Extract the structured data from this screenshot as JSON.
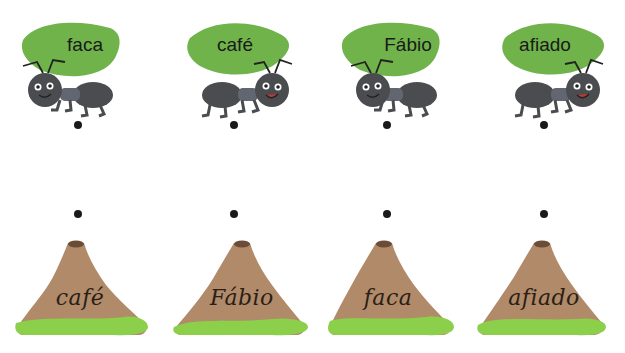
{
  "colors": {
    "leaf": "#6fb34a",
    "ant_body": "#4a4c50",
    "hill": "#b08a69",
    "grass": "#8ccf4a",
    "crater": "#6b4c36",
    "dot": "#1a1a1a"
  },
  "ants": [
    {
      "word": "faca",
      "facing": "left"
    },
    {
      "word": "café",
      "facing": "right"
    },
    {
      "word": "Fábio",
      "facing": "left"
    },
    {
      "word": "afiado",
      "facing": "right"
    }
  ],
  "hills": [
    {
      "word": "café"
    },
    {
      "word": "Fábio"
    },
    {
      "word": "faca"
    },
    {
      "word": "afiado"
    }
  ]
}
